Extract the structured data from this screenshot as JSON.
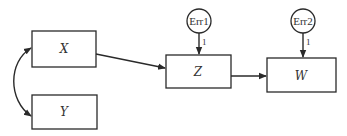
{
  "diagram": {
    "nodes": {
      "x": {
        "label": "X",
        "shape": "rectangle"
      },
      "y": {
        "label": "Y",
        "shape": "rectangle"
      },
      "z": {
        "label": "Z",
        "shape": "rectangle"
      },
      "w": {
        "label": "W",
        "shape": "rectangle"
      },
      "err1": {
        "label": "Err1",
        "shape": "circle"
      },
      "err2": {
        "label": "Err2",
        "shape": "circle"
      }
    },
    "edges": [
      {
        "from": "X",
        "to": "Y",
        "type": "curved-double-arrow"
      },
      {
        "from": "X",
        "to": "Z",
        "type": "arrow"
      },
      {
        "from": "Z",
        "to": "W",
        "type": "arrow"
      },
      {
        "from": "Err1",
        "to": "Z",
        "type": "arrow",
        "label": "1"
      },
      {
        "from": "Err2",
        "to": "W",
        "type": "arrow",
        "label": "1"
      }
    ],
    "edge_labels": {
      "err1_coef": "1",
      "err2_coef": "1"
    }
  }
}
